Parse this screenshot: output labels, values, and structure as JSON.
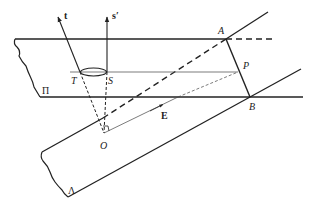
{
  "diagram": {
    "type": "geometry-plane-intersection",
    "colors": {
      "stroke": "#222222",
      "background": "#ffffff"
    },
    "planes": [
      {
        "id": "Pi",
        "label": "Π"
      },
      {
        "id": "Lambda",
        "label": "Λ"
      }
    ],
    "points": [
      {
        "id": "A",
        "label": "A"
      },
      {
        "id": "B",
        "label": "B"
      },
      {
        "id": "P",
        "label": "P"
      },
      {
        "id": "S",
        "label": "S"
      },
      {
        "id": "T",
        "label": "T"
      },
      {
        "id": "O",
        "label": "O"
      }
    ],
    "vectors": [
      {
        "id": "t",
        "label": "t"
      },
      {
        "id": "s_prime",
        "label": "s′"
      },
      {
        "id": "E",
        "label": "E"
      }
    ]
  }
}
